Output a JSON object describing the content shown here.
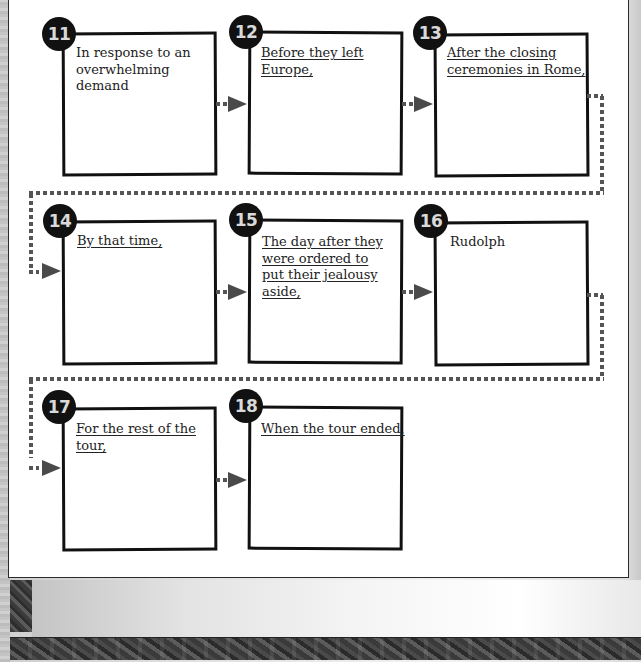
{
  "worksheet": {
    "boxes": [
      {
        "number": "11",
        "prompt": "In response to an overwhelming demand",
        "underlined": false
      },
      {
        "number": "12",
        "prompt": "Before they left Europe,",
        "underlined": true
      },
      {
        "number": "13",
        "prompt": "After the closing ceremonies in Rome,",
        "underlined": true
      },
      {
        "number": "14",
        "prompt": "By that time,",
        "underlined": true
      },
      {
        "number": "15",
        "prompt": "The day after they were ordered to put their jealousy aside,",
        "underlined": true
      },
      {
        "number": "16",
        "prompt": "Rudolph",
        "underlined": false
      },
      {
        "number": "17",
        "prompt": "For the rest of the tour,",
        "underlined": true
      },
      {
        "number": "18",
        "prompt": "When the tour ended,",
        "underlined": true
      }
    ],
    "connector_color": "#555555",
    "arrow_color": "#4a4a4a",
    "badge_color": "#111111"
  }
}
